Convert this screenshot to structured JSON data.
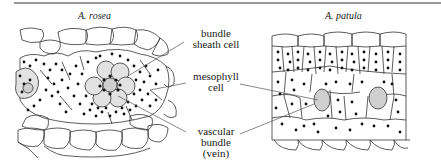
{
  "figure": {
    "panels": [
      {
        "id": "left",
        "title": "A. rosea"
      },
      {
        "id": "right",
        "title": "A. patula"
      }
    ],
    "labels": [
      {
        "id": "bundle-sheath-cell",
        "line1": "bundle",
        "line2": "sheath cell",
        "line3": ""
      },
      {
        "id": "mesophyll-cell",
        "line1": "mesophyll",
        "line2": "cell",
        "line3": ""
      },
      {
        "id": "vascular-bundle",
        "line1": "vascular",
        "line2": "bundle",
        "line3": "(vein)"
      }
    ],
    "colors": {
      "outline": "#333333",
      "chloroplast": "#111111",
      "vein_fill": "#cfcfcf",
      "sheath_fill": "#e2e2e2",
      "rule": "#9a9a9a"
    }
  }
}
